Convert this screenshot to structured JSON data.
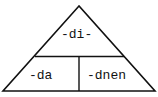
{
  "diagram": {
    "shape": "triangle",
    "top": {
      "label": "-di-"
    },
    "bottom_left": {
      "label": "-da"
    },
    "bottom_right": {
      "label": "-dnen"
    }
  },
  "colors": {
    "stroke": "#111111",
    "background": "#ffffff"
  }
}
